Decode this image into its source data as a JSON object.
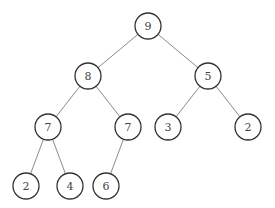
{
  "diagram": {
    "type": "binary-tree",
    "node_radius": 13,
    "colors": {
      "edge": "#8a8a8a",
      "node_stroke": "#333333",
      "node_fill": "#ffffff",
      "label": "#444444"
    },
    "nodes": [
      {
        "id": "n0",
        "label": "9",
        "x": 148,
        "y": 26
      },
      {
        "id": "n1",
        "label": "8",
        "x": 88,
        "y": 76
      },
      {
        "id": "n2",
        "label": "5",
        "x": 208,
        "y": 76
      },
      {
        "id": "n3",
        "label": "7",
        "x": 48,
        "y": 127
      },
      {
        "id": "n4",
        "label": "7",
        "x": 128,
        "y": 127
      },
      {
        "id": "n5",
        "label": "3",
        "x": 168,
        "y": 127
      },
      {
        "id": "n6",
        "label": "2",
        "x": 248,
        "y": 127
      },
      {
        "id": "n7",
        "label": "2",
        "x": 26,
        "y": 186
      },
      {
        "id": "n8",
        "label": "4",
        "x": 70,
        "y": 186
      },
      {
        "id": "n9",
        "label": "6",
        "x": 106,
        "y": 186
      }
    ],
    "edges": [
      [
        "n0",
        "n1"
      ],
      [
        "n0",
        "n2"
      ],
      [
        "n1",
        "n3"
      ],
      [
        "n1",
        "n4"
      ],
      [
        "n2",
        "n5"
      ],
      [
        "n2",
        "n6"
      ],
      [
        "n3",
        "n7"
      ],
      [
        "n3",
        "n8"
      ],
      [
        "n4",
        "n9"
      ]
    ]
  }
}
